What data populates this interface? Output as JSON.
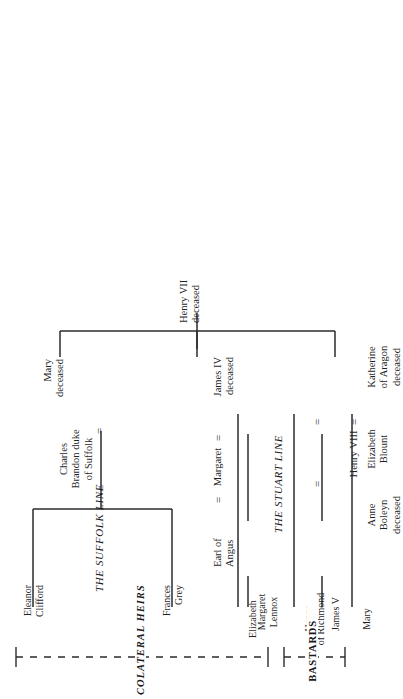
{
  "diagram": {
    "orientation": "rotated-90-ccw",
    "ink_color": "#2b2b2b",
    "paper_color": "#ffffff"
  },
  "root": {
    "name": "Henry VII",
    "status": "deceased"
  },
  "generation2": {
    "mary": {
      "name": "Mary",
      "status": "deceased"
    },
    "mary_spouse": {
      "line1": "Charles",
      "line2": "Brandon duke",
      "line3": "of Suffolk"
    },
    "margaret": {
      "name": "Margaret"
    },
    "margaret_spouse_left": {
      "name": "James IV",
      "status": "deceased"
    },
    "margaret_spouse_right": {
      "line1": "Earl of",
      "line2": "Angus"
    },
    "henry8": {
      "name": "Henry VIII"
    },
    "henry8_wife_1": {
      "line1": "Katherine",
      "line2": "of Aragon",
      "line3": "deceased"
    },
    "henry8_wife_2": {
      "line1": "Elizabeth",
      "line2": "Blount"
    },
    "henry8_wife_3": {
      "line1": "Anne",
      "line2": "Boleyn",
      "line3": "deceased"
    }
  },
  "marriage_symbol": "=",
  "marriage_symbols": {
    "mary_charles": "=",
    "james_margaret": "=",
    "margaret_angus": "=",
    "katherine_henry8": "=",
    "henry8_elizabeth_blount": "=",
    "henry8_anne_boleyn": "="
  },
  "line_labels": {
    "suffolk": {
      "line1": "THE SUFFOLK",
      "line2": "LINE"
    },
    "stuart": {
      "line1": "THE STUART",
      "line2": "LINE"
    }
  },
  "children": {
    "eleanor": {
      "line1": "Eleanor",
      "line2": "Clifford"
    },
    "frances": {
      "line1": "Frances",
      "line2": "Grey"
    },
    "margaret_lennox": {
      "line1": "Margaret",
      "line2": "Lennox"
    },
    "james5": {
      "line1": "James V",
      "line2": ""
    },
    "elizabeth": {
      "line1": "Elizabeth",
      "line2": ""
    },
    "henry_richmond": {
      "line1": "Henry",
      "line2": "of Richmond"
    },
    "mary": {
      "line1": "Mary",
      "line2": ""
    }
  },
  "brackets": {
    "colateral_heirs": "COLATERAL HEIRS",
    "bastards": "BASTARDS"
  }
}
